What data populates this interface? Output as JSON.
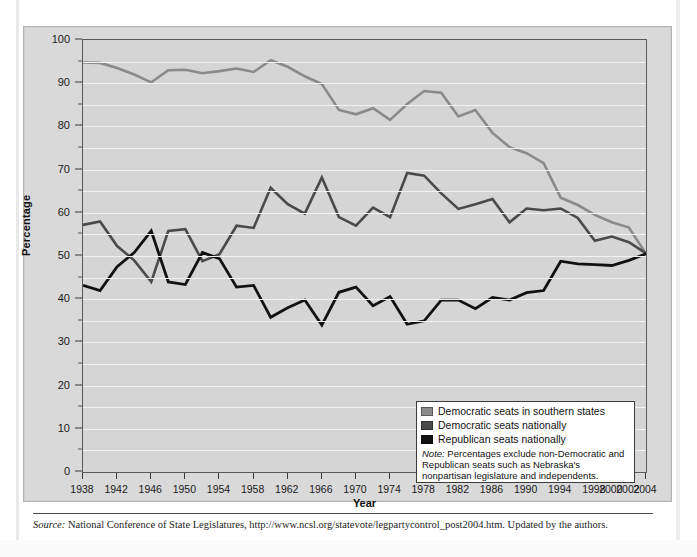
{
  "figure": {
    "y_axis": {
      "title": "Percentage",
      "min": 0,
      "max": 100,
      "major_step": 10,
      "minor_step": 5,
      "ticks": [
        0,
        10,
        20,
        30,
        40,
        50,
        60,
        70,
        80,
        90,
        100
      ]
    },
    "x_axis": {
      "title": "Year",
      "tick_labels": [
        "1938",
        "1942",
        "1946",
        "1950",
        "1954",
        "1958",
        "1962",
        "1966",
        "1970",
        "1974",
        "1978",
        "1982",
        "1986",
        "1990",
        "1994",
        "1998",
        "2000",
        "2002",
        "2004"
      ]
    },
    "legend": {
      "items": [
        {
          "label": "Democratic seats in southern states",
          "color": "#8a8a8a",
          "swatch": "legend-swatch-southern"
        },
        {
          "label": "Democratic seats nationally",
          "color": "#4a4a4a",
          "swatch": "legend-swatch-democratic"
        },
        {
          "label": "Republican seats nationally",
          "color": "#111111",
          "swatch": "legend-swatch-republican"
        }
      ],
      "note_prefix": "Note:",
      "note_text": " Percentages exclude non-Democratic and Republican seats such as Nebraska's nonpartisan legislature and independents."
    },
    "source": {
      "prefix": "Source:",
      "text": " National Conference of State Legislatures, http://www.ncsl.org/statevote/legpartycontrol_post2004.htm. Updated by the authors."
    }
  },
  "chart_data": {
    "type": "line",
    "title": "",
    "xlabel": "Year",
    "ylabel": "Percentage",
    "ylim": [
      0,
      100
    ],
    "grid": true,
    "legend_position": "inside-bottom-right",
    "x": [
      1938,
      1940,
      1942,
      1944,
      1946,
      1948,
      1950,
      1952,
      1954,
      1956,
      1958,
      1960,
      1962,
      1964,
      1966,
      1968,
      1970,
      1972,
      1974,
      1976,
      1978,
      1980,
      1982,
      1984,
      1986,
      1988,
      1990,
      1992,
      1994,
      1996,
      1998,
      2000,
      2002,
      2004
    ],
    "x_tick_labels": [
      "1938",
      "1942",
      "1946",
      "1950",
      "1954",
      "1958",
      "1962",
      "1966",
      "1970",
      "1974",
      "1978",
      "1982",
      "1986",
      "1990",
      "1994",
      "1998",
      "2000",
      "2002",
      "2004"
    ],
    "series": [
      {
        "name": "Democratic seats in southern states",
        "color": "#8a8a8a",
        "values": [
          94.8,
          94.7,
          93.5,
          92.0,
          90.2,
          93.0,
          93.1,
          92.3,
          92.8,
          93.4,
          92.6,
          95.3,
          93.8,
          91.6,
          89.8,
          83.8,
          82.8,
          84.2,
          81.5,
          85.2,
          88.2,
          87.8,
          82.3,
          83.8,
          78.5,
          75.2,
          73.8,
          71.5,
          63.5,
          61.8,
          59.5,
          57.8,
          56.6,
          50.5
        ]
      },
      {
        "name": "Democratic seats nationally",
        "color": "#4a4a4a",
        "values": [
          57.2,
          58.0,
          52.3,
          49.0,
          44.0,
          55.8,
          56.2,
          48.8,
          50.4,
          57.0,
          56.5,
          65.8,
          62.0,
          59.8,
          68.2,
          59.0,
          57.0,
          61.2,
          59.0,
          69.2,
          68.6,
          64.5,
          60.9,
          62.0,
          63.2,
          57.8,
          61.0,
          60.6,
          61.0,
          58.8,
          53.5,
          54.5,
          53.2,
          50.6
        ]
      },
      {
        "name": "Republican seats nationally",
        "color": "#111111",
        "values": [
          43.2,
          42.0,
          47.5,
          50.8,
          55.8,
          44.0,
          43.4,
          50.8,
          49.4,
          42.8,
          43.2,
          35.8,
          38.0,
          39.8,
          34.0,
          41.6,
          42.8,
          38.5,
          40.6,
          34.2,
          35.0,
          39.8,
          39.8,
          37.8,
          40.4,
          39.8,
          41.5,
          42.0,
          48.8,
          48.2,
          48.0,
          47.8,
          49.0,
          50.5
        ]
      }
    ]
  }
}
